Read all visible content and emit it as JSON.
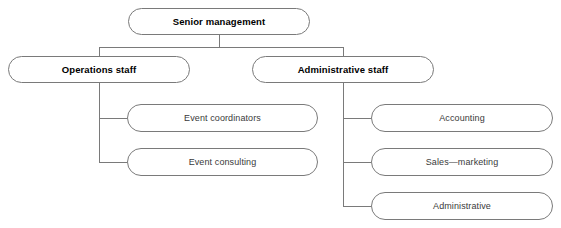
{
  "diagram": {
    "type": "organizational-chart",
    "orientation": "top-down",
    "background_color": "#ffffff",
    "line_color": "#7a7a7a",
    "box_border_color": "#7a7a7a",
    "text_color": "#000000"
  },
  "nodes": {
    "senior_management": {
      "label": "Senior management",
      "level": 1,
      "bold": true,
      "x": 128,
      "y": 8,
      "w": 182,
      "h": 27,
      "radius": 13.5
    },
    "operations_staff": {
      "label": "Operations staff",
      "level": 2,
      "bold": true,
      "x": 8,
      "y": 56,
      "w": 182,
      "h": 27,
      "radius": 13.5
    },
    "administrative_staff": {
      "label": "Administrative staff",
      "level": 2,
      "bold": true,
      "x": 252,
      "y": 56,
      "w": 182,
      "h": 27,
      "radius": 13.5
    },
    "event_coordinators": {
      "label": "Event coordinators",
      "level": 3,
      "bold": false,
      "x": 127,
      "y": 104,
      "w": 191,
      "h": 28,
      "radius": 14
    },
    "event_consulting": {
      "label": "Event consulting",
      "level": 3,
      "bold": false,
      "x": 127,
      "y": 148,
      "w": 191,
      "h": 28,
      "radius": 14
    },
    "accounting": {
      "label": "Accounting",
      "level": 3,
      "bold": false,
      "x": 371,
      "y": 104,
      "w": 182,
      "h": 28,
      "radius": 14
    },
    "sales_marketing": {
      "label": "Sales—marketing",
      "level": 3,
      "bold": false,
      "x": 371,
      "y": 148,
      "w": 182,
      "h": 28,
      "radius": 14
    },
    "administrative": {
      "label": "Administrative",
      "level": 3,
      "bold": false,
      "x": 371,
      "y": 192,
      "w": 182,
      "h": 28,
      "radius": 14
    }
  },
  "connectors": [
    {
      "name": "senior-to-busbar",
      "points": "219,35 219,47"
    },
    {
      "name": "level2-busbar",
      "points": "99,47 343,47"
    },
    {
      "name": "busbar-to-operations",
      "points": "99,47 99,56"
    },
    {
      "name": "busbar-to-administrative",
      "points": "343,47 343,56"
    },
    {
      "name": "operations-trunk",
      "points": "99,83 99,162"
    },
    {
      "name": "operations-to-event-coordinators",
      "points": "99,118 127,118"
    },
    {
      "name": "operations-to-event-consulting",
      "points": "99,162 127,162"
    },
    {
      "name": "administrative-trunk",
      "points": "343,83 343,206"
    },
    {
      "name": "administrative-to-accounting",
      "points": "343,118 371,118"
    },
    {
      "name": "administrative-to-sales-marketing",
      "points": "343,162 371,162"
    },
    {
      "name": "administrative-to-administrative",
      "points": "343,206 371,206"
    }
  ]
}
